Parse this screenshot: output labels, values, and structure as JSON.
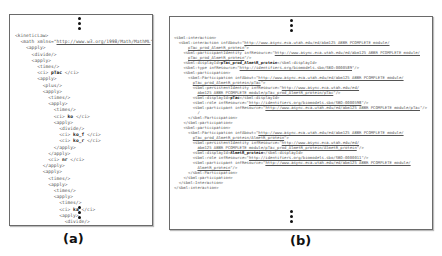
{
  "panels": [
    {
      "id": "a",
      "caption": "(a)",
      "lines": [
        {
          "indent": 0,
          "parts": [
            {
              "t": "<kineticLaw>"
            }
          ]
        },
        {
          "indent": 1,
          "parts": [
            {
              "t": "<math xmlns=\""
            },
            {
              "t": "http://www.w3.org/1998/Math/MathML",
              "u": true
            },
            {
              "t": "\">"
            }
          ]
        },
        {
          "indent": 2,
          "parts": [
            {
              "t": "<apply>"
            }
          ]
        },
        {
          "indent": 3,
          "parts": [
            {
              "t": "<divide/>"
            }
          ]
        },
        {
          "indent": 3,
          "parts": [
            {
              "t": "<apply>"
            }
          ]
        },
        {
          "indent": 4,
          "parts": [
            {
              "t": "<times/>"
            }
          ]
        },
        {
          "indent": 4,
          "parts": [
            {
              "t": "<ci> "
            },
            {
              "t": "pTac",
              "b": true
            },
            {
              "t": " </ci>"
            }
          ]
        },
        {
          "indent": 4,
          "parts": [
            {
              "t": "<apply>"
            }
          ]
        },
        {
          "indent": 5,
          "parts": [
            {
              "t": "<plus/>"
            }
          ]
        },
        {
          "indent": 5,
          "parts": [
            {
              "t": "<apply>"
            }
          ]
        },
        {
          "indent": 6,
          "parts": [
            {
              "t": "<times/>"
            }
          ]
        },
        {
          "indent": 6,
          "parts": [
            {
              "t": "<apply>"
            }
          ]
        },
        {
          "indent": 7,
          "parts": [
            {
              "t": "<times/>"
            }
          ]
        },
        {
          "indent": 7,
          "parts": [
            {
              "t": "<ci> "
            },
            {
              "t": "ko",
              "b": true
            },
            {
              "t": " </ci>"
            }
          ]
        },
        {
          "indent": 7,
          "parts": [
            {
              "t": "<apply>"
            }
          ]
        },
        {
          "indent": 8,
          "parts": [
            {
              "t": "<divide/>"
            }
          ]
        },
        {
          "indent": 8,
          "parts": [
            {
              "t": "<ci> "
            },
            {
              "t": "ko_f",
              "b": true
            },
            {
              "t": " </ci>"
            }
          ]
        },
        {
          "indent": 8,
          "parts": [
            {
              "t": "<ci> "
            },
            {
              "t": "ko_r",
              "b": true
            },
            {
              "t": " </ci>"
            }
          ]
        },
        {
          "indent": 7,
          "parts": [
            {
              "t": "</apply>"
            }
          ]
        },
        {
          "indent": 6,
          "parts": [
            {
              "t": "</apply>"
            }
          ]
        },
        {
          "indent": 6,
          "parts": [
            {
              "t": "<ci> "
            },
            {
              "t": "nr",
              "b": true
            },
            {
              "t": " </ci>"
            }
          ]
        },
        {
          "indent": 5,
          "parts": [
            {
              "t": "</apply>"
            }
          ]
        },
        {
          "indent": 5,
          "parts": [
            {
              "t": "<apply>"
            }
          ]
        },
        {
          "indent": 6,
          "parts": [
            {
              "t": "<times/>"
            }
          ]
        },
        {
          "indent": 6,
          "parts": [
            {
              "t": "<apply>"
            }
          ]
        },
        {
          "indent": 7,
          "parts": [
            {
              "t": "<times/>"
            }
          ]
        },
        {
          "indent": 7,
          "parts": [
            {
              "t": "<apply>"
            }
          ]
        },
        {
          "indent": 8,
          "parts": [
            {
              "t": "<times/>"
            }
          ]
        },
        {
          "indent": 8,
          "parts": [
            {
              "t": "<ci> "
            },
            {
              "t": "ka",
              "b": true
            },
            {
              "t": " </ci>"
            }
          ]
        },
        {
          "indent": 8,
          "parts": [
            {
              "t": "<apply>"
            }
          ]
        },
        {
          "indent": 9,
          "parts": [
            {
              "t": "<divide/>"
            }
          ]
        },
        {
          "indent": 9,
          "parts": [
            {
              "t": "<ci> "
            },
            {
              "t": "kao_f",
              "b": true
            },
            {
              "t": " </ci>"
            }
          ]
        },
        {
          "indent": 9,
          "parts": [
            {
              "t": "<ci> "
            },
            {
              "t": "kao_r",
              "b": true
            },
            {
              "t": " </ci>"
            }
          ]
        }
      ]
    },
    {
      "id": "b",
      "caption": "(b)",
      "lines": [
        {
          "indent": 0,
          "parts": [
            {
              "t": "<sbml:interaction>"
            }
          ]
        },
        {
          "indent": 1,
          "parts": [
            {
              "t": "<sbml:interaction infAbout=\""
            },
            {
              "t": "http://www.async.eca.utah.edu/ed/abm125 ABBR PCOMPLETE module/",
              "u": true
            }
          ]
        },
        {
          "indent": 3,
          "parts": [
            {
              "t": "pTac_prod_AlmetR_protein",
              "u": true
            },
            {
              "t": "\">"
            }
          ]
        },
        {
          "indent": 2,
          "parts": [
            {
              "t": "<sbml:participantIdentity infResource=\""
            },
            {
              "t": "http://www.async.eca.utah.edu/ed/abm125 ABBR PCOMPLETE module/",
              "u": true
            }
          ]
        },
        {
          "indent": 3,
          "parts": [
            {
              "t": "pTac_prod_AlmetR_protein",
              "u": true
            },
            {
              "t": "\"/>"
            }
          ]
        },
        {
          "indent": 2,
          "parts": [
            {
              "t": "<sbml:displayId>"
            },
            {
              "t": "pTac_prod_AlmetR_protein",
              "b": true
            },
            {
              "t": "</sbml:displayId>"
            }
          ]
        },
        {
          "indent": 2,
          "parts": [
            {
              "t": "<sbml:type infResource=\""
            },
            {
              "t": "http://identifiers.org/biomodels.sbo/SBO:0000589",
              "u": true
            },
            {
              "t": "\"/>"
            }
          ]
        },
        {
          "indent": 2,
          "parts": [
            {
              "t": "<sbml:participation>"
            }
          ]
        },
        {
          "indent": 3,
          "parts": [
            {
              "t": "<sbml:Participation infAbout=\""
            },
            {
              "t": "http://www.async.eca.utah.edu/ed/abm125 ABBR PCOMPLETE module/",
              "u": true
            }
          ]
        },
        {
          "indent": 4,
          "parts": [
            {
              "t": "pTac_prod_AlmetR_protein/pTac",
              "u": true
            },
            {
              "t": "\">"
            }
          ]
        },
        {
          "indent": 4,
          "parts": [
            {
              "t": "<sbml:persistentIdentity infResource=\""
            },
            {
              "t": "http://www.async.eca.utah.edu/ed/",
              "u": true
            }
          ]
        },
        {
          "indent": 5,
          "parts": [
            {
              "t": "abm125 ABBR PCOMPLETE module/pTac_prod_AlmetR_protein/pTac",
              "u": true
            },
            {
              "t": "\"/>"
            }
          ]
        },
        {
          "indent": 4,
          "parts": [
            {
              "t": "<sbml:displayId>"
            },
            {
              "t": "pTac",
              "b": true
            },
            {
              "t": "</sbml:displayId>"
            }
          ]
        },
        {
          "indent": 4,
          "parts": [
            {
              "t": "<sbml:role infResource=\""
            },
            {
              "t": "http://identifiers.org/biomodels.sbo/SBO:0000598",
              "u": true
            },
            {
              "t": "\"/>"
            }
          ]
        },
        {
          "indent": 4,
          "parts": [
            {
              "t": "<sbml:participant infResource=\""
            },
            {
              "t": "http://www.async.eca.utah.edu/ed/abm125 ABBR PCOMPLETE module/pTac",
              "u": true
            },
            {
              "t": "\"/>"
            }
          ]
        },
        {
          "indent": 5,
          "parts": [
            {
              "t": "/"
            }
          ]
        },
        {
          "indent": 3,
          "parts": [
            {
              "t": "</sbml:Participation>"
            }
          ]
        },
        {
          "indent": 2,
          "parts": [
            {
              "t": "</sbml:participation>"
            }
          ]
        },
        {
          "indent": 2,
          "parts": [
            {
              "t": "<sbml:participation>"
            }
          ]
        },
        {
          "indent": 3,
          "parts": [
            {
              "t": "<sbml:Participation infAbout=\""
            },
            {
              "t": "http://www.async.eca.utah.edu/ed/abm125 ABBR PCOMPLETE module/",
              "u": true
            }
          ]
        },
        {
          "indent": 4,
          "parts": [
            {
              "t": "pTac_prod_AlmetR_protein/AlmetR_protein",
              "u": true
            },
            {
              "t": "\">"
            }
          ]
        },
        {
          "indent": 4,
          "parts": [
            {
              "t": "<sbml:persistentIdentity infResource=\""
            },
            {
              "t": "http://www.async.eca.utah.edu/ed/",
              "u": true
            }
          ]
        },
        {
          "indent": 5,
          "parts": [
            {
              "t": "abm125 ABBR PCOMPLETE module/pTac_prod_AlmetR_protein/AlmetR_protein",
              "u": true
            },
            {
              "t": "\"/>"
            }
          ]
        },
        {
          "indent": 4,
          "parts": [
            {
              "t": "<sbml:displayId>"
            },
            {
              "t": "AlmetR_protein",
              "b": true
            },
            {
              "t": "</sbml:displayId>"
            }
          ]
        },
        {
          "indent": 4,
          "parts": [
            {
              "t": "<sbml:role infResource=\""
            },
            {
              "t": "http://identifiers.org/biomodels.sbo/SBO:0000011",
              "u": true
            },
            {
              "t": "\"/>"
            }
          ]
        },
        {
          "indent": 4,
          "parts": [
            {
              "t": "<sbml:participant infResource=\""
            },
            {
              "t": "http://www.async.eca.utah.edu/ed/abm125 ABBR PCOMPLETE module/",
              "u": true
            }
          ]
        },
        {
          "indent": 5,
          "parts": [
            {
              "t": "AlmetR_protein",
              "u": true
            },
            {
              "t": "\"/>"
            }
          ]
        },
        {
          "indent": 3,
          "parts": [
            {
              "t": "</sbml:Participation>"
            }
          ]
        },
        {
          "indent": 2,
          "parts": [
            {
              "t": "</sbml:participation>"
            }
          ]
        },
        {
          "indent": 1,
          "parts": [
            {
              "t": "</sbml:Interaction>"
            }
          ]
        },
        {
          "indent": 0,
          "parts": [
            {
              "t": "</sbml:interaction>"
            }
          ]
        }
      ]
    }
  ]
}
